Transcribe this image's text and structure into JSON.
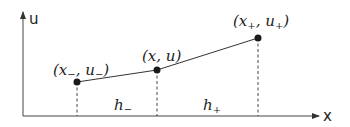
{
  "diagram": {
    "axes": {
      "x_label": "x",
      "y_label": "u"
    },
    "points": [
      {
        "id": "left",
        "label_base": "(x",
        "label_sub1": "−",
        "label_mid": ", u",
        "label_sub2": "−",
        "label_end": ")",
        "cx": 77,
        "cy": 82
      },
      {
        "id": "center",
        "label": "(x, u)",
        "cx": 157,
        "cy": 70
      },
      {
        "id": "right",
        "label_base": "(x",
        "label_sub1": "+",
        "label_mid": ", u",
        "label_sub2": "+",
        "label_end": ")",
        "cx": 258,
        "cy": 38
      }
    ],
    "intervals": [
      {
        "id": "h-minus",
        "base": "h",
        "sub": "−"
      },
      {
        "id": "h-plus",
        "base": "h",
        "sub": "+"
      }
    ],
    "colors": {
      "line": "#333333",
      "point": "#1a1a1a",
      "text": "#222222"
    }
  }
}
